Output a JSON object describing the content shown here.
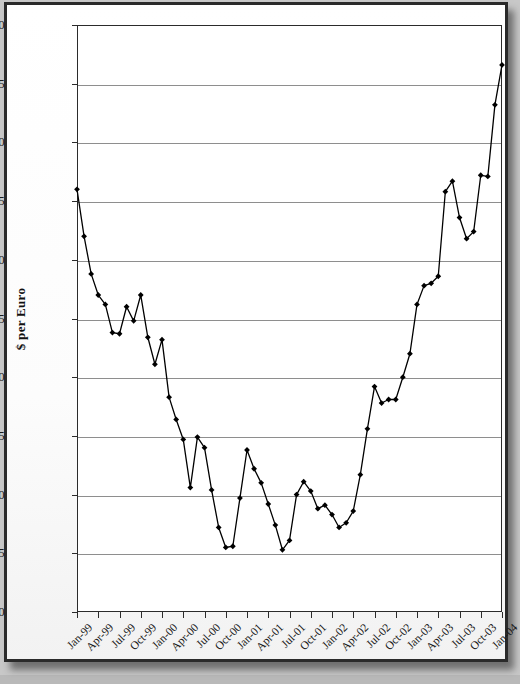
{
  "chart_data": {
    "type": "line",
    "title": "",
    "xlabel": "",
    "ylabel": "$ per Euro",
    "ylim": [
      0.8,
      1.3
    ],
    "ytick_step": 0.05,
    "ytick_labels": [
      "1.30",
      "1.25",
      "1.20",
      "1.15",
      "1.10",
      "1.05",
      "1.00",
      "0.95",
      "0.90",
      "0.85",
      "0.80"
    ],
    "ytick_values": [
      1.3,
      1.25,
      1.2,
      1.15,
      1.1,
      1.05,
      1.0,
      0.95,
      0.9,
      0.85,
      0.8
    ],
    "grid": true,
    "grid_axis": "y",
    "legend": false,
    "marker": "diamond",
    "line_color": "#000000",
    "marker_color": "#000000",
    "grid_color": "#8e8e8e",
    "axis_color": "#2b2b2b",
    "plot_background": "#ffffff",
    "xtick_labels": [
      "Jan-99",
      "Apr-99",
      "Jul-99",
      "Oct-99",
      "Jan-00",
      "Apr-00",
      "Jul-00",
      "Oct-00",
      "Jan-01",
      "Apr-01",
      "Jul-01",
      "Oct-01",
      "Jan-02",
      "Apr-02",
      "Jul-02",
      "Oct-02",
      "Jan-03",
      "Apr-03",
      "Jul-03",
      "Oct-03",
      "Jan-04"
    ],
    "xtick_interval_months": 3,
    "x": [
      "Jan-99",
      "Feb-99",
      "Mar-99",
      "Apr-99",
      "May-99",
      "Jun-99",
      "Jul-99",
      "Aug-99",
      "Sep-99",
      "Oct-99",
      "Nov-99",
      "Dec-99",
      "Jan-00",
      "Feb-00",
      "Mar-00",
      "Apr-00",
      "May-00",
      "Jun-00",
      "Jul-00",
      "Aug-00",
      "Sep-00",
      "Oct-00",
      "Nov-00",
      "Dec-00",
      "Jan-01",
      "Feb-01",
      "Mar-01",
      "Apr-01",
      "May-01",
      "Jun-01",
      "Jul-01",
      "Aug-01",
      "Sep-01",
      "Oct-01",
      "Nov-01",
      "Dec-01",
      "Jan-02",
      "Feb-02",
      "Mar-02",
      "Apr-02",
      "May-02",
      "Jun-02",
      "Jul-02",
      "Aug-02",
      "Sep-02",
      "Oct-02",
      "Nov-02",
      "Dec-02",
      "Jan-03",
      "Feb-03",
      "Mar-03",
      "Apr-03",
      "May-03",
      "Jun-03",
      "Jul-03",
      "Aug-03",
      "Sep-03",
      "Oct-03",
      "Nov-03",
      "Dec-03",
      "Jan-04"
    ],
    "values": [
      1.16,
      1.12,
      1.088,
      1.07,
      1.062,
      1.038,
      1.037,
      1.06,
      1.048,
      1.07,
      1.034,
      1.011,
      1.032,
      0.983,
      0.964,
      0.947,
      0.906,
      0.949,
      0.94,
      0.904,
      0.872,
      0.855,
      0.856,
      0.897,
      0.938,
      0.922,
      0.91,
      0.892,
      0.874,
      0.853,
      0.861,
      0.9,
      0.911,
      0.903,
      0.888,
      0.891,
      0.883,
      0.872,
      0.876,
      0.886,
      0.917,
      0.956,
      0.992,
      0.978,
      0.981,
      0.981,
      1.0,
      1.02,
      1.062,
      1.078,
      1.08,
      1.086,
      1.158,
      1.167,
      1.136,
      1.118,
      1.124,
      1.172,
      1.171,
      1.232,
      1.266
    ]
  }
}
